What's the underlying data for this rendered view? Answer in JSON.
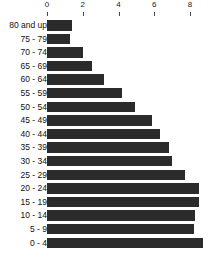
{
  "chart_data": {
    "type": "bar",
    "orientation": "horizontal",
    "title": "",
    "subtitle": "",
    "xlabel": "",
    "ylabel": "",
    "categories": [
      "80 and up",
      "75 - 79",
      "70 - 74",
      "65 - 69",
      "60 - 64",
      "55 - 59",
      "50 - 54",
      "45 - 49",
      "40 - 44",
      "35 - 39",
      "30 - 34",
      "25 - 29",
      "20 - 24",
      "15 - 19",
      "10 - 14",
      "5 - 9",
      "0 - 4"
    ],
    "values": [
      1.4,
      1.3,
      2.0,
      2.5,
      3.2,
      4.2,
      4.9,
      5.9,
      6.3,
      6.8,
      7.0,
      7.7,
      8.5,
      8.5,
      8.3,
      8.2,
      8.7
    ],
    "xlim": [
      0,
      8.9
    ],
    "xticks": [
      0,
      2,
      4,
      6,
      8
    ],
    "xtick_labels": [
      "0",
      "2",
      "4",
      "6",
      "8"
    ],
    "axis_position": "top",
    "grid": false,
    "legend": false,
    "bar_color": "#2b2b2b",
    "background_color": "#ffffff",
    "tick_color": "#4a4a4a",
    "label_color": "#111111"
  }
}
